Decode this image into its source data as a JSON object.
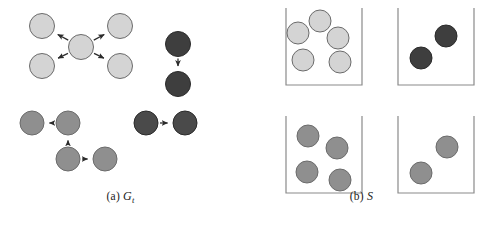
{
  "figure": {
    "width": 482,
    "height": 225,
    "background": "#ffffff"
  },
  "palette": {
    "node_light": "#d4d4d4",
    "node_medium": "#8f8f8f",
    "node_dark": "#3e3e3e",
    "node_dark_alt": "#4a4a4a",
    "node_stroke": "#6b6b6b",
    "node_stroke_dark": "#2a2a2a",
    "arrow": "#2b2b2b",
    "bin_stroke": "#8a8a8a",
    "text": "#1a1a1a"
  },
  "panels": [
    {
      "id": "panel-a",
      "caption_prefix": "(a)",
      "caption_symbol": "G",
      "caption_subscript": "t",
      "caption_full": "(a) G_t",
      "kind": "directed-graph",
      "components": [
        {
          "name": "star-component",
          "color_key": "node_light",
          "nodes": [
            {
              "id": "a1-center",
              "cx": 81,
              "cy": 47,
              "r": 12.5
            },
            {
              "id": "a1-tl",
              "cx": 42,
              "cy": 26,
              "r": 12.5
            },
            {
              "id": "a1-tr",
              "cx": 120,
              "cy": 26,
              "r": 12.5
            },
            {
              "id": "a1-bl",
              "cx": 42,
              "cy": 66,
              "r": 12.5
            },
            {
              "id": "a1-br",
              "cx": 120,
              "cy": 66,
              "r": 12.5
            }
          ],
          "edges": [
            {
              "from": "a1-center",
              "to": "a1-tl"
            },
            {
              "from": "a1-center",
              "to": "a1-tr"
            },
            {
              "from": "a1-center",
              "to": "a1-bl"
            },
            {
              "from": "a1-center",
              "to": "a1-br"
            }
          ]
        },
        {
          "name": "dark-vertical-pair",
          "color_key": "node_dark",
          "nodes": [
            {
              "id": "a2-top",
              "cx": 178,
              "cy": 44,
              "r": 12.5
            },
            {
              "id": "a2-bot",
              "cx": 178,
              "cy": 84,
              "r": 12.5
            }
          ],
          "edges": [
            {
              "from": "a2-top",
              "to": "a2-bot"
            }
          ]
        },
        {
          "name": "medium-chain-component",
          "color_key": "node_medium",
          "nodes": [
            {
              "id": "a3-left",
              "cx": 32,
              "cy": 123,
              "r": 12
            },
            {
              "id": "a3-mid",
              "cx": 68,
              "cy": 123,
              "r": 12
            },
            {
              "id": "a3-bottom",
              "cx": 68,
              "cy": 159,
              "r": 12
            },
            {
              "id": "a3-right",
              "cx": 105,
              "cy": 159,
              "r": 12
            }
          ],
          "edges": [
            {
              "from": "a3-mid",
              "to": "a3-left"
            },
            {
              "from": "a3-bottom",
              "to": "a3-mid"
            },
            {
              "from": "a3-bottom",
              "to": "a3-right"
            }
          ]
        },
        {
          "name": "dark-horizontal-pair",
          "color_key": "node_dark_alt",
          "nodes": [
            {
              "id": "a4-left",
              "cx": 146,
              "cy": 123,
              "r": 12
            },
            {
              "id": "a4-right",
              "cx": 185,
              "cy": 123,
              "r": 12
            }
          ],
          "edges": [
            {
              "from": "a4-left",
              "to": "a4-right"
            }
          ]
        }
      ]
    },
    {
      "id": "panel-b",
      "caption_prefix": "(b)",
      "caption_symbol": "S",
      "caption_subscript": "",
      "caption_full": "(b) S",
      "kind": "bins",
      "bins": [
        {
          "name": "bin-top-left",
          "x": 45,
          "y": 8,
          "width": 76,
          "height": 77,
          "color_key": "node_light",
          "count": 5,
          "circles": [
            {
              "cx": 79,
              "cy": 21,
              "r": 11
            },
            {
              "cx": 57,
              "cy": 33,
              "r": 11
            },
            {
              "cx": 97,
              "cy": 38,
              "r": 11
            },
            {
              "cx": 62,
              "cy": 60,
              "r": 11
            },
            {
              "cx": 99,
              "cy": 62,
              "r": 11
            }
          ]
        },
        {
          "name": "bin-top-right",
          "x": 157,
          "y": 8,
          "width": 76,
          "height": 77,
          "color_key": "node_dark",
          "count": 2,
          "circles": [
            {
              "cx": 205,
              "cy": 36,
              "r": 11
            },
            {
              "cx": 180,
              "cy": 58,
              "r": 11
            }
          ]
        },
        {
          "name": "bin-bottom-left",
          "x": 45,
          "y": 116,
          "width": 76,
          "height": 77,
          "color_key": "node_medium",
          "count": 4,
          "circles": [
            {
              "cx": 67,
              "cy": 136,
              "r": 11
            },
            {
              "cx": 96,
              "cy": 148,
              "r": 11
            },
            {
              "cx": 66,
              "cy": 172,
              "r": 11
            },
            {
              "cx": 99,
              "cy": 180,
              "r": 11
            }
          ]
        },
        {
          "name": "bin-bottom-right",
          "x": 157,
          "y": 116,
          "width": 76,
          "height": 77,
          "color_key": "node_medium",
          "count": 2,
          "circles": [
            {
              "cx": 206,
              "cy": 147,
              "r": 11
            },
            {
              "cx": 180,
              "cy": 173,
              "r": 11
            }
          ]
        }
      ]
    }
  ]
}
